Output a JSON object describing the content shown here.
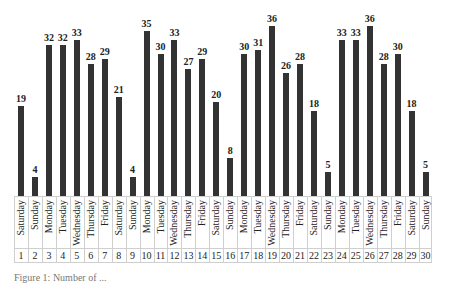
{
  "chart_data": {
    "type": "bar",
    "title": "",
    "xlabel": "",
    "ylabel": "",
    "ylim": [
      0,
      36
    ],
    "grid": false,
    "legend": null,
    "categories": [
      "1",
      "2",
      "3",
      "4",
      "5",
      "6",
      "7",
      "8",
      "9",
      "10",
      "11",
      "12",
      "13",
      "14",
      "15",
      "16",
      "17",
      "18",
      "19",
      "20",
      "21",
      "22",
      "23",
      "24",
      "25",
      "26",
      "27",
      "28",
      "29",
      "30"
    ],
    "weekdays": [
      "Saturday",
      "Sunday",
      "Monday",
      "Tuesday",
      "Wednesday",
      "Thursday",
      "Friday",
      "Saturday",
      "Sunday",
      "Monday",
      "Tuesday",
      "Wednesday",
      "Thursday",
      "Friday",
      "Saturday",
      "Sunday",
      "Monday",
      "Tuesday",
      "Wednesday",
      "Thursday",
      "Friday",
      "Saturday",
      "Sunday",
      "Monday",
      "Tuesday",
      "Wednesday",
      "Thursday",
      "Friday",
      "Saturday",
      "Sunday"
    ],
    "values": [
      19,
      4,
      32,
      32,
      33,
      28,
      29,
      21,
      4,
      35,
      30,
      33,
      27,
      29,
      20,
      8,
      30,
      31,
      36,
      26,
      28,
      18,
      5,
      33,
      33,
      36,
      28,
      30,
      18,
      5
    ],
    "bar_color": "#333333"
  },
  "caption": "Figure 1: Number of ..."
}
